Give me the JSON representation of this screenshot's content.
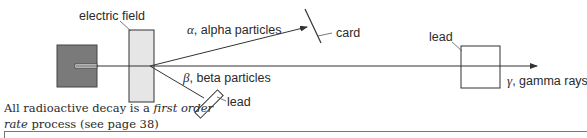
{
  "diagram": {
    "labels": {
      "electric_field": "electric field",
      "alpha_symbol": "α",
      "alpha_text": ", alpha particles",
      "beta_symbol": "β",
      "beta_text": ", beta particles",
      "gamma_symbol": "γ",
      "gamma_text": ", gamma rays",
      "card": "card",
      "lead_beta": "lead",
      "lead_gamma": "lead"
    },
    "colors": {
      "source_fill": "#7a7a7a",
      "field_plate_fill": "#e6e6e6",
      "line": "#333333"
    }
  },
  "caption": {
    "part1": "All radioactive decay is a ",
    "italic1": "first order",
    "italic2": "rate",
    "part2": " process (see page 38)"
  }
}
